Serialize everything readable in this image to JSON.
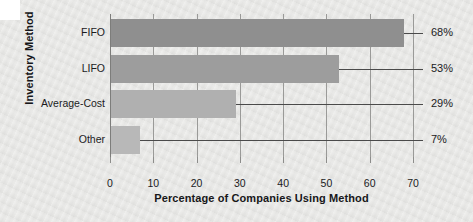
{
  "chart_data": {
    "type": "bar",
    "orientation": "horizontal",
    "title": "",
    "xlabel": "Percentage of Companies Using Method",
    "ylabel": "Inventory Method",
    "categories": [
      "FIFO",
      "LIFO",
      "Average-Cost",
      "Other"
    ],
    "values": [
      68,
      53,
      29,
      7
    ],
    "value_labels": [
      "68%",
      "53%",
      "29%",
      "7%"
    ],
    "xlim": [
      0,
      70
    ],
    "x_ticks": [
      0,
      10,
      20,
      30,
      40,
      50,
      60,
      70
    ],
    "x_tick_labels": [
      "0",
      "10",
      "20",
      "30",
      "40",
      "50",
      "60",
      "70"
    ],
    "grid": "vertical",
    "legend": "none",
    "bar_colors": [
      "#8f8f8f",
      "#9d9d9d",
      "#b0b0b0",
      "#b8b8b8"
    ],
    "plot_background": "#ececea",
    "figure_background": "#e9e9e7"
  },
  "axes": {
    "y_title": "Inventory Method",
    "x_title": "Percentage of Companies Using Method"
  }
}
